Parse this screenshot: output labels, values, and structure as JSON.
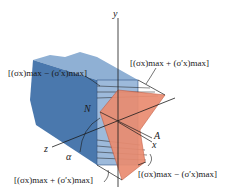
{
  "figure": {
    "type": "beam-stress-distribution",
    "axes": {
      "y": "y",
      "z": "z",
      "x": "x"
    },
    "points": {
      "neutral": "N",
      "axis": "A"
    },
    "angle": "α",
    "labels": {
      "top_left": "[(σx)max − (σ'x)max]",
      "top_right": "[(σx)max + (σ'x)max]",
      "bottom_left": "[(σx)max + (σ'x)max]",
      "bottom_right": "[(σx)max − (σ'x)max]"
    },
    "colors": {
      "beam": "#4a78ad",
      "beam_light": "#7fa3cc",
      "beam_dark": "#2f5687",
      "stress": "#ea8c70",
      "stress_edge": "#c2553a",
      "line": "#1a1a1a"
    }
  }
}
